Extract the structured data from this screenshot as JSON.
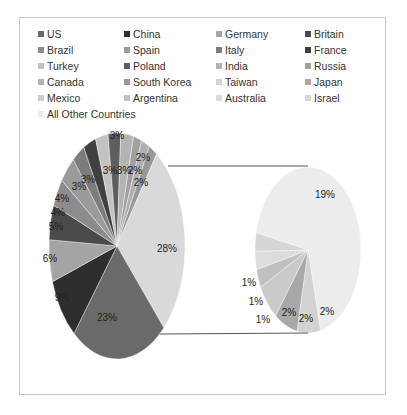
{
  "chart_data": {
    "type": "pie",
    "subtype": "pie-of-pie",
    "title": "",
    "legend_position": "top",
    "main_pie": {
      "slices": [
        {
          "label": "US",
          "value": 23,
          "color": "#6a6a6a"
        },
        {
          "label": "China",
          "value": 9,
          "color": "#2e2e2e"
        },
        {
          "label": "Germany",
          "value": 6,
          "color": "#a4a4a4"
        },
        {
          "label": "Britain",
          "value": 5,
          "color": "#4a4a4a"
        },
        {
          "label": "Brazil",
          "value": 4,
          "color": "#8c8c8c"
        },
        {
          "label": "Spain",
          "value": 4,
          "color": "#9a9a9a"
        },
        {
          "label": "Italy",
          "value": 3,
          "color": "#7c7c7c"
        },
        {
          "label": "France",
          "value": 3,
          "color": "#404040"
        },
        {
          "label": "Turkey",
          "value": 3,
          "color": "#c2c2c2"
        },
        {
          "label": "Poland",
          "value": 3,
          "color": "#5e5e5e"
        },
        {
          "label": "India",
          "value": 3,
          "color": "#b4b4b4"
        },
        {
          "label": "Russia",
          "value": 2,
          "color": "#a0a0a0"
        },
        {
          "label": "Canada",
          "value": 2,
          "color": "#b0b0b0"
        },
        {
          "label": "South Korea",
          "value": 2,
          "color": "#989898"
        },
        {
          "label": "Other (split)",
          "value": 28,
          "color": "#d9d9d9"
        }
      ]
    },
    "secondary_pie": {
      "slices": [
        {
          "label": "Taiwan",
          "value": 2,
          "color": "#d2d2d2"
        },
        {
          "label": "Japan",
          "value": 2,
          "color": "#a8a8a8"
        },
        {
          "label": "Mexico",
          "value": 2,
          "color": "#cacaca"
        },
        {
          "label": "Argentina",
          "value": 1,
          "color": "#c0c0c0"
        },
        {
          "label": "Australia",
          "value": 1,
          "color": "#dcdcdc"
        },
        {
          "label": "Israel",
          "value": 1,
          "color": "#d6d6d6"
        },
        {
          "label": "All Other Countries",
          "value": 19,
          "color": "#ececec"
        }
      ]
    },
    "data_labels": {
      "main": [
        "3%",
        "2%",
        "2%",
        "2%",
        "28%",
        "23%",
        "9%",
        "6%",
        "5%",
        "4%",
        "4%",
        "3%",
        "3%",
        "3%",
        "3%"
      ],
      "secondary": [
        "19%",
        "2%",
        "2%",
        "2%",
        "1%",
        "1%",
        "1%"
      ]
    }
  },
  "legend": {
    "items": [
      {
        "label": "US",
        "color": "#6a6a6a"
      },
      {
        "label": "China",
        "color": "#2e2e2e"
      },
      {
        "label": "Germany",
        "color": "#a4a4a4"
      },
      {
        "label": "Britain",
        "color": "#4a4a4a"
      },
      {
        "label": "Brazil",
        "color": "#8c8c8c"
      },
      {
        "label": "Spain",
        "color": "#9a9a9a"
      },
      {
        "label": "Italy",
        "color": "#7c7c7c"
      },
      {
        "label": "France",
        "color": "#404040"
      },
      {
        "label": "Turkey",
        "color": "#c2c2c2"
      },
      {
        "label": "Poland",
        "color": "#5e5e5e"
      },
      {
        "label": "India",
        "color": "#b4b4b4"
      },
      {
        "label": "Russia",
        "color": "#a0a0a0"
      },
      {
        "label": "Canada",
        "color": "#b0b0b0"
      },
      {
        "label": "South Korea",
        "color": "#989898"
      },
      {
        "label": "Taiwan",
        "color": "#d2d2d2"
      },
      {
        "label": "Japan",
        "color": "#a8a8a8"
      },
      {
        "label": "Mexico",
        "color": "#cacaca"
      },
      {
        "label": "Argentina",
        "color": "#c0c0c0"
      },
      {
        "label": "Australia",
        "color": "#dcdcdc"
      },
      {
        "label": "Israel",
        "color": "#d6d6d6"
      },
      {
        "label": "All Other Countries",
        "color": "#ececec"
      }
    ]
  }
}
